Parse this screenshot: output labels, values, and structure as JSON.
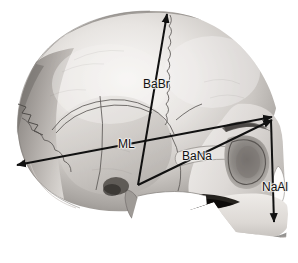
{
  "figure": {
    "background_color": "#ffffff",
    "width": 298,
    "height": 263,
    "line_color": "#111111"
  },
  "measurements": [
    {
      "id": "babr",
      "label": "BaBr",
      "description": "Basion to Bregma (cranial height)",
      "label_x": 143,
      "label_y": 78,
      "line": {
        "x1": 138,
        "y1": 185,
        "x2": 167,
        "y2": 14
      },
      "arrowheads": [
        "end"
      ]
    },
    {
      "id": "ml",
      "label": "ML",
      "description": "Maximum cranial length",
      "label_x": 118,
      "label_y": 138,
      "line": {
        "x1": 17,
        "y1": 165,
        "x2": 272,
        "y2": 117
      },
      "arrowheads": [
        "start",
        "end"
      ]
    },
    {
      "id": "bana",
      "label": "BaNa",
      "description": "Basion to Nasion (cranial base length)",
      "label_x": 182,
      "label_y": 150,
      "line": {
        "x1": 138,
        "y1": 185,
        "x2": 272,
        "y2": 120
      },
      "arrowheads": [
        "end"
      ]
    },
    {
      "id": "naal",
      "label": "NaAl",
      "description": "Nasion to Alveolare (upper facial height)",
      "label_x": 262,
      "label_y": 181,
      "line": {
        "x1": 271,
        "y1": 120,
        "x2": 274,
        "y2": 222
      },
      "arrowheads": [
        "end"
      ]
    }
  ],
  "anatomy_regions": [
    {
      "name": "cranial-vault",
      "tone": "light-gray"
    },
    {
      "name": "temporal-bone",
      "tone": "mid-gray"
    },
    {
      "name": "occipital-bone",
      "tone": "dark-gray"
    },
    {
      "name": "orbit",
      "tone": "dark-shadow"
    },
    {
      "name": "zygomatic-arch",
      "tone": "light-gray"
    },
    {
      "name": "maxilla-teeth",
      "tone": "light-gray"
    },
    {
      "name": "styloid-process",
      "tone": "mid-gray"
    },
    {
      "name": "nasal-aperture",
      "tone": "dark-shadow"
    }
  ]
}
